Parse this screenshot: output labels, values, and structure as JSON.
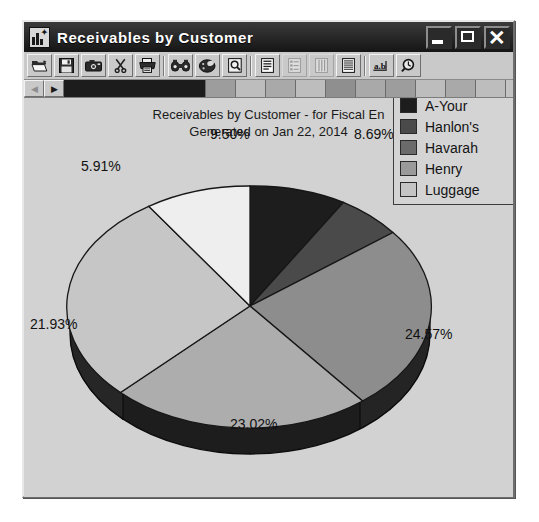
{
  "window": {
    "title": "Receivables by Customer",
    "icon": "chart-report-icon",
    "controls": [
      {
        "name": "minimize-button",
        "glyph": "minimize"
      },
      {
        "name": "maximize-button",
        "glyph": "maximize"
      },
      {
        "name": "close-button",
        "glyph": "close"
      }
    ]
  },
  "toolbar": {
    "buttons": [
      {
        "name": "open-button",
        "icon": "folder-open-icon",
        "enabled": true
      },
      {
        "name": "save-button",
        "icon": "floppy-disk-icon",
        "enabled": true
      },
      {
        "name": "snapshot-button",
        "icon": "camera-icon",
        "enabled": true
      },
      {
        "name": "cut-button",
        "icon": "scissors-icon",
        "enabled": true
      },
      {
        "name": "print-button",
        "icon": "printer-icon",
        "enabled": true
      },
      {
        "name": "view-chart-button",
        "icon": "binoculars-icon",
        "enabled": true
      },
      {
        "name": "palette-button",
        "icon": "palette-icon",
        "enabled": true
      },
      {
        "name": "print-preview-button",
        "icon": "page-magnifier-icon",
        "enabled": true
      },
      {
        "name": "report-view-button",
        "icon": "document-lines-icon",
        "enabled": true
      },
      {
        "name": "outline-view-button",
        "icon": "document-tree-icon",
        "enabled": false
      },
      {
        "name": "column-view-button",
        "icon": "columns-icon",
        "enabled": false
      },
      {
        "name": "list-view-button",
        "icon": "list-rows-icon",
        "enabled": true
      },
      {
        "name": "text-field-button",
        "icon": "ab-text-icon",
        "enabled": true
      },
      {
        "name": "search-button",
        "icon": "magnifier-clock-icon",
        "enabled": true
      }
    ]
  },
  "nav_strip": {
    "prev_arrow": {
      "name": "scroll-left-arrow",
      "glyph": "◀",
      "enabled": false
    },
    "next_arrow": {
      "name": "scroll-right-arrow",
      "glyph": "▶",
      "enabled": true
    },
    "tabs": [
      {
        "name": "tab-selected",
        "state": "selected",
        "width": 142
      },
      {
        "name": "tab-2",
        "state": "g1",
        "width": 30
      },
      {
        "name": "tab-3",
        "state": "g2",
        "width": 30
      },
      {
        "name": "tab-4",
        "state": "g3",
        "width": 30
      },
      {
        "name": "tab-5",
        "state": "g2",
        "width": 30
      },
      {
        "name": "tab-6",
        "state": "g4",
        "width": 30
      },
      {
        "name": "tab-7",
        "state": "g3",
        "width": 30
      },
      {
        "name": "tab-8",
        "state": "g1",
        "width": 30
      },
      {
        "name": "tab-9",
        "state": "g2",
        "width": 30
      },
      {
        "name": "tab-10",
        "state": "g3",
        "width": 30
      },
      {
        "name": "tab-11",
        "state": "g2",
        "width": 30
      }
    ]
  },
  "chart_data": {
    "type": "pie",
    "title": "Receivables by Customer - for Fiscal En",
    "subtitle": "Generated on Jan 22, 2014",
    "title_clipped": true,
    "legend_position": "top-right",
    "legend_clipped": true,
    "categories": [
      "A-Your",
      "Hanlon's",
      "Havarah",
      "Henry",
      "Luggage",
      "Other"
    ],
    "values": [
      8.69,
      5.91,
      24.57,
      23.02,
      21.93,
      9.5
    ],
    "labels": [
      "8.69%",
      "5.91%",
      "24.57%",
      "23.02%",
      "21.93%",
      "9.50%"
    ],
    "colors": [
      "#1d1d1d",
      "#4a4a4a",
      "#8d8d8d",
      "#adadad",
      "#c6c6c6",
      "#eeeeee"
    ],
    "legend_entries": [
      {
        "label": "A-Your",
        "color": "#1d1d1d"
      },
      {
        "label": "Hanlon's",
        "color": "#4a4a4a"
      },
      {
        "label": "Havarah",
        "color": "#6b6b6b"
      },
      {
        "label": "Henry",
        "color": "#9a9a9a"
      },
      {
        "label": "Luggage",
        "color": "#c4c4c4"
      }
    ]
  },
  "pct_labels": {
    "p1": "8.69%",
    "p2": "9.50%",
    "p3": "5.91%",
    "p4": "21.93%",
    "p5": "23.02%",
    "p6": "24.57%"
  }
}
